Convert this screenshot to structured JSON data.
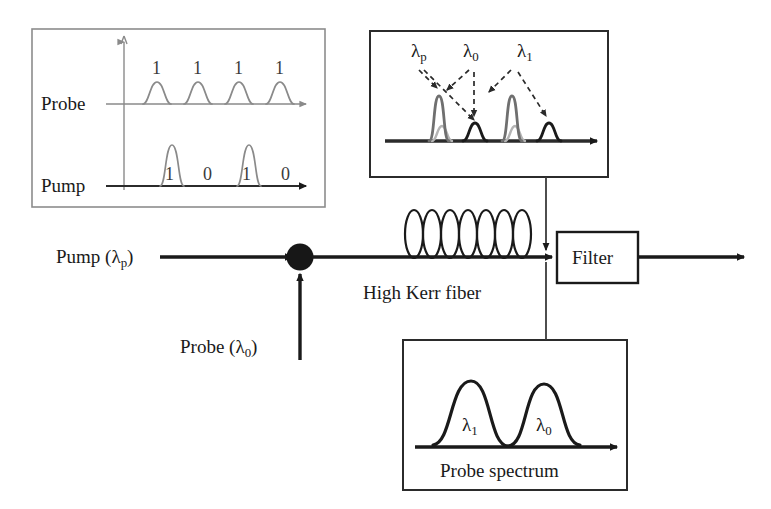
{
  "figure": {
    "background_color": "#ffffff",
    "ink_color": "#1a1a1a",
    "faint_color": "#8a8a8a",
    "panel_border_color": "#8c8c8c"
  },
  "timing_panel": {
    "name": "pump-probe-timing-panel",
    "probe_row_label": "Probe",
    "pump_row_label": "Pump",
    "probe_bits": [
      "1",
      "1",
      "1",
      "1"
    ],
    "pump_bits": [
      "1",
      "0",
      "1",
      "0"
    ],
    "probe_pulse_present": [
      true,
      true,
      true,
      true
    ],
    "pump_pulse_present": [
      true,
      false,
      true,
      false
    ]
  },
  "output_spectrum_panel": {
    "name": "output-spectrum-panel",
    "labels": [
      {
        "base": "λ",
        "sub": "p"
      },
      {
        "base": "λ",
        "sub": "0"
      },
      {
        "base": "λ",
        "sub": "1"
      }
    ],
    "peaks": [
      {
        "id": "peak-lambda-p-1",
        "kind": "tall",
        "color": "#6f6f6f"
      },
      {
        "id": "peak-lambda-0-1",
        "kind": "short",
        "color": "#1a1a1a"
      },
      {
        "id": "peak-lambda-p-2",
        "kind": "tall",
        "color": "#6f6f6f"
      },
      {
        "id": "peak-lambda-1-1",
        "kind": "short",
        "color": "#1a1a1a"
      }
    ]
  },
  "probe_spectrum_panel": {
    "name": "probe-spectrum-panel",
    "caption": "Probe spectrum",
    "peak_labels": [
      {
        "base": "λ",
        "sub": "1"
      },
      {
        "base": "λ",
        "sub": "0"
      }
    ]
  },
  "schematic": {
    "pump_input_label": {
      "text": "Pump (λ",
      "sub": "p",
      "tail": ")"
    },
    "probe_input_label": {
      "text": "Probe (λ",
      "sub": "0",
      "tail": ")"
    },
    "fiber_label": "High Kerr fiber",
    "filter_label": "Filter",
    "coupler_name": "coupler-node",
    "coil_turns": 7
  }
}
